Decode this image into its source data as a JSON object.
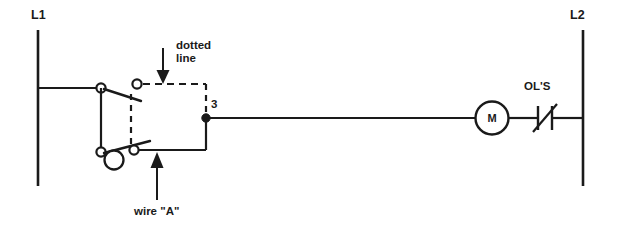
{
  "diagram": {
    "labels": {
      "left_rail": "L1",
      "right_rail": "L2",
      "dotted_line_annotation": "dotted\nline",
      "wire_a_annotation": "wire \"A\"",
      "node_number": "3",
      "overload_label": "OL'S",
      "motor_label": "M"
    },
    "colors": {
      "line": "#1a1a1a",
      "background": "#ffffff",
      "text": "#1a1a1a"
    },
    "components": [
      {
        "name": "left-power-rail",
        "type": "vertical-rail",
        "label": "L1"
      },
      {
        "name": "right-power-rail",
        "type": "vertical-rail",
        "label": "L2"
      },
      {
        "name": "upper-switch-contact",
        "type": "normally-open-contact-pair",
        "style": "open-circles-with-blade"
      },
      {
        "name": "lower-switch-contact",
        "type": "normally-open-contact-pair",
        "style": "open-circles-with-blade-and-pivot"
      },
      {
        "name": "junction-node",
        "type": "solid-junction-dot",
        "label": "3"
      },
      {
        "name": "motor",
        "type": "motor-coil-circle",
        "label": "M"
      },
      {
        "name": "overload-contacts",
        "type": "overload-relay-contact",
        "label": "OL'S"
      }
    ],
    "annotations": [
      {
        "name": "dotted-line-callout",
        "text": "dotted\nline",
        "arrow_direction": "down"
      },
      {
        "name": "wire-a-callout",
        "text": "wire \"A\"",
        "arrow_direction": "up"
      }
    ]
  }
}
